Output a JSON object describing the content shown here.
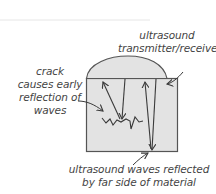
{
  "diagram": {
    "labels": {
      "transducer": [
        "ultrasound",
        "transmitter/receiver"
      ],
      "crack": [
        "crack",
        "causes early",
        "reflection of",
        "waves"
      ],
      "far_side": [
        "ultrasound waves reflected",
        "by far side of material"
      ]
    },
    "components": [
      {
        "id": "transducer",
        "name": "ultrasound transmitter/receiver",
        "shape": "dome"
      },
      {
        "id": "material",
        "name": "material block",
        "shape": "rectangle"
      },
      {
        "id": "crack",
        "name": "crack",
        "shape": "zigzag"
      }
    ],
    "waves": [
      {
        "from": "transducer",
        "to": "crack",
        "direction": "down"
      },
      {
        "from": "crack",
        "to": "transducer",
        "direction": "up"
      },
      {
        "from": "transducer",
        "to": "far side of material",
        "direction": "down"
      },
      {
        "from": "far side of material",
        "to": "transducer",
        "direction": "up"
      }
    ],
    "colors": {
      "material_fill": "#e3e3e3",
      "outline": "#555555",
      "text": "#444444",
      "arrow": "#3a3a3a"
    }
  }
}
